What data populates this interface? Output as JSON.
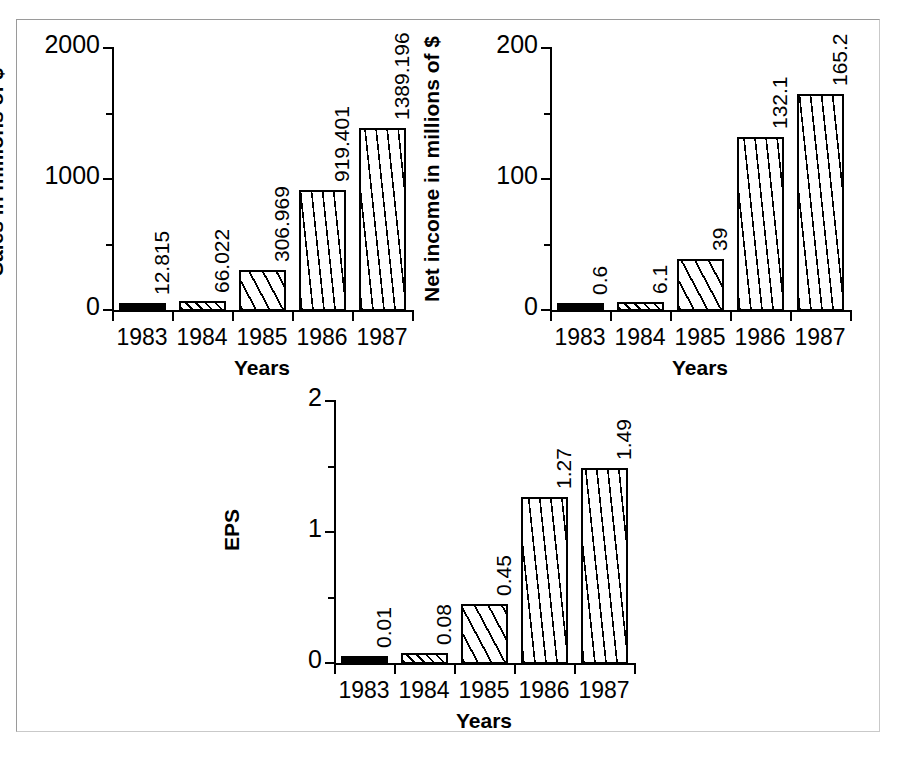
{
  "figure": {
    "background_color": "#ffffff",
    "frame_color": "#9a9a9a",
    "ink_color": "#000000"
  },
  "chart_data": [
    {
      "id": "sales",
      "type": "bar",
      "title": "",
      "xlabel": "Years",
      "ylabel": "Sales in millions of $",
      "categories": [
        "1983",
        "1984",
        "1985",
        "1986",
        "1987"
      ],
      "values": [
        12.815,
        66.022,
        306.969,
        919.401,
        1389.196
      ],
      "value_labels": [
        "12.815",
        "66.022",
        "306.969",
        "919.401",
        "1389.196"
      ],
      "ylim": [
        0,
        2000
      ],
      "yticks": [
        0,
        1000,
        2000
      ],
      "ytick_labels": [
        "0",
        "1000",
        "2000"
      ],
      "yminor_ticks": [
        500,
        1500
      ],
      "grid": false,
      "legend": "none",
      "bar_patterns": [
        "solid",
        "diag-dense",
        "diag-wide",
        "vert",
        "vert"
      ]
    },
    {
      "id": "net-income",
      "type": "bar",
      "title": "",
      "xlabel": "Years",
      "ylabel": "Net income in millions of $",
      "categories": [
        "1983",
        "1984",
        "1985",
        "1986",
        "1987"
      ],
      "values": [
        0.6,
        6.1,
        39,
        132.1,
        165.2
      ],
      "value_labels": [
        "0.6",
        "6.1",
        "39",
        "132.1",
        "165.2"
      ],
      "ylim": [
        0,
        200
      ],
      "yticks": [
        0,
        100,
        200
      ],
      "ytick_labels": [
        "0",
        "100",
        "200"
      ],
      "yminor_ticks": [
        50,
        150
      ],
      "grid": false,
      "legend": "none",
      "bar_patterns": [
        "solid",
        "diag-dense",
        "diag-wide",
        "vert",
        "vert"
      ]
    },
    {
      "id": "eps",
      "type": "bar",
      "title": "",
      "xlabel": "Years",
      "ylabel": "EPS",
      "categories": [
        "1983",
        "1984",
        "1985",
        "1986",
        "1987"
      ],
      "values": [
        0.01,
        0.08,
        0.45,
        1.27,
        1.49
      ],
      "value_labels": [
        "0.01",
        "0.08",
        "0.45",
        "1.27",
        "1.49"
      ],
      "ylim": [
        0,
        2
      ],
      "yticks": [
        0,
        1,
        2
      ],
      "ytick_labels": [
        "0",
        "1",
        "2"
      ],
      "yminor_ticks": [
        0.5,
        1.5
      ],
      "grid": false,
      "legend": "none",
      "bar_patterns": [
        "solid",
        "diag-dense",
        "diag-wide",
        "vert",
        "vert"
      ]
    }
  ]
}
